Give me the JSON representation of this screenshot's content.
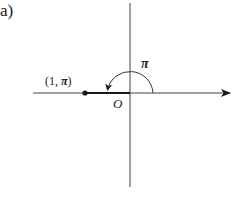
{
  "figure": {
    "panel_label": "a)",
    "point": {
      "label_prefix": "(1, ",
      "label_angle": "π",
      "label_suffix": ")",
      "r": 1,
      "theta": "π"
    },
    "origin_label": "O",
    "angle_label": "π",
    "colors": {
      "ink": "#1a1a1a",
      "axis": "#444444",
      "background": "#ffffff"
    }
  }
}
